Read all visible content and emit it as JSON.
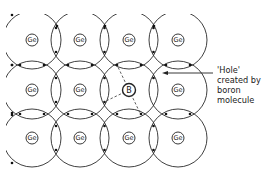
{
  "diagram": {
    "grid": {
      "columns_x": [
        32,
        80,
        129,
        178
      ],
      "rows_y": [
        40,
        90,
        138
      ]
    },
    "atoms": [
      {
        "label": "Ge",
        "row": 0,
        "col": 0
      },
      {
        "label": "Ge",
        "row": 0,
        "col": 1
      },
      {
        "label": "Ge",
        "row": 0,
        "col": 2
      },
      {
        "label": "Ge",
        "row": 0,
        "col": 3
      },
      {
        "label": "Ge",
        "row": 1,
        "col": 0
      },
      {
        "label": "Ge",
        "row": 1,
        "col": 1
      },
      {
        "label": "B",
        "row": 1,
        "col": 2
      },
      {
        "label": "Ge",
        "row": 1,
        "col": 3
      },
      {
        "label": "Ge",
        "row": 2,
        "col": 0
      },
      {
        "label": "Ge",
        "row": 2,
        "col": 1
      },
      {
        "label": "Ge",
        "row": 2,
        "col": 2
      },
      {
        "label": "Ge",
        "row": 2,
        "col": 3
      }
    ],
    "annotation": {
      "lines": [
        "'Hole'",
        "created by",
        "boron",
        "molecule"
      ]
    },
    "colors": {
      "line": "#2a2a2a",
      "background": "#ffffff"
    }
  }
}
